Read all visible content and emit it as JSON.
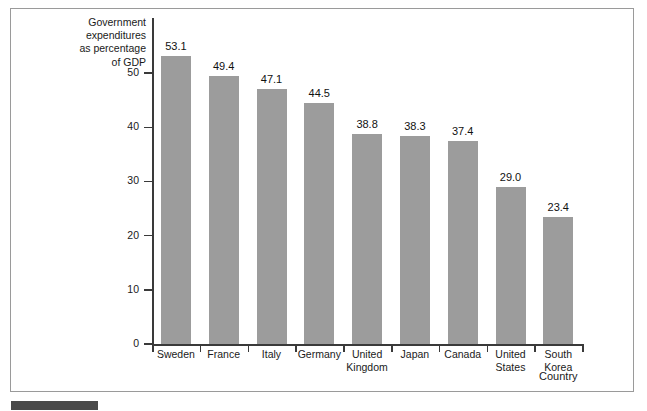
{
  "figure": {
    "background_color": "#ffffff",
    "frame_border_color": "#9a9a9a",
    "caption_bar_color": "#4a4a4a",
    "bar_color": "#9c9c9c",
    "axis_color": "#3a3a3a",
    "text_color": "#1a1a1a"
  },
  "chart_data": {
    "type": "bar",
    "title": "",
    "ylabel": "Government\nexpenditures\nas percentage\nof GDP",
    "xlabel": "Country",
    "categories": [
      "Sweden",
      "France",
      "Italy",
      "Germany",
      "United\nKingdom",
      "Japan",
      "Canada",
      "United\nStates",
      "South\nKorea"
    ],
    "values": [
      53.1,
      49.4,
      47.1,
      44.5,
      38.8,
      38.3,
      37.4,
      29.0,
      23.4
    ],
    "value_labels": [
      "53.1",
      "49.4",
      "47.1",
      "44.5",
      "38.8",
      "38.3",
      "37.4",
      "29.0",
      "23.4"
    ],
    "ylim": [
      0,
      55
    ],
    "yticks": [
      0,
      10,
      20,
      30,
      40,
      50
    ],
    "ytick_labels": [
      "0",
      "10",
      "20",
      "30",
      "40",
      "50"
    ],
    "grid": false,
    "legend": null,
    "legend_position": "none",
    "series": [
      {
        "name": "Government expenditures as percentage of GDP",
        "values": [
          53.1,
          49.4,
          47.1,
          44.5,
          38.8,
          38.3,
          37.4,
          29.0,
          23.4
        ]
      }
    ]
  }
}
